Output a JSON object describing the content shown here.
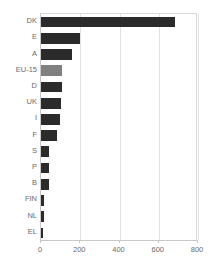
{
  "chart_data": {
    "type": "bar",
    "orientation": "horizontal",
    "title": "",
    "xlabel": "",
    "ylabel": "",
    "xlim": [
      0,
      800
    ],
    "xticks": [
      0,
      200,
      400,
      600,
      800
    ],
    "grid": true,
    "legend": "none",
    "categories": [
      "DK",
      "E",
      "A",
      "EU-15",
      "D",
      "UK",
      "I",
      "F",
      "S",
      "P",
      "B",
      "FIN",
      "NL",
      "EL"
    ],
    "values": [
      683,
      198,
      157,
      105,
      105,
      103,
      95,
      80,
      40,
      42,
      42,
      15,
      15,
      8
    ],
    "series": [
      {
        "name": "value",
        "values": [
          683,
          198,
          157,
          105,
          105,
          103,
          95,
          80,
          40,
          42,
          42,
          15,
          15,
          8
        ]
      }
    ],
    "highlight_category": "EU-15",
    "colors": {
      "bar": "#2b2b2b",
      "bar_highlight": "#808080",
      "gridline": "#e2e2e2",
      "axis": "#c8c8c8",
      "text": "#6b6b6b",
      "background": "#ffffff"
    }
  }
}
